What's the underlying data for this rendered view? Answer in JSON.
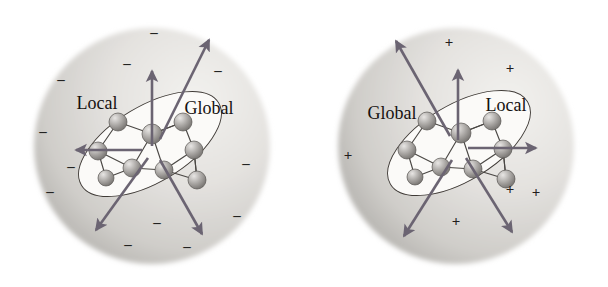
{
  "figure": {
    "background_color": "#ffffff",
    "width": 608,
    "height": 287
  },
  "colors": {
    "sphere_light": "#f2f1ee",
    "sphere_mid": "#cfcdc9",
    "sphere_dark": "#9d9b97",
    "cavity_fill": "#fbfaf8",
    "cavity_stroke": "#3f3a36",
    "arrow": "#6b6472",
    "atom_light": "#e8e6e4",
    "atom_mid": "#a9a6a3",
    "atom_dark": "#6a6764",
    "bond": "#4a4744",
    "sign_text": "#221d1c",
    "label_text": "#15110f"
  },
  "panels": [
    {
      "id": "panel-left",
      "name": "negative-solvent-panel",
      "sign_symbol": "–",
      "sign_kind": "minus",
      "sign_count": 12,
      "labels": [
        {
          "name": "local-label",
          "text": "Local",
          "x": 97,
          "y": 103
        },
        {
          "name": "global-label",
          "text": "Global",
          "x": 209,
          "y": 108
        }
      ],
      "signs": [
        {
          "x": 154,
          "y": 32
        },
        {
          "x": 127,
          "y": 63
        },
        {
          "x": 218,
          "y": 70
        },
        {
          "x": 61,
          "y": 79
        },
        {
          "x": 246,
          "y": 163
        },
        {
          "x": 71,
          "y": 166
        },
        {
          "x": 50,
          "y": 191
        },
        {
          "x": 237,
          "y": 215
        },
        {
          "x": 157,
          "y": 222
        },
        {
          "x": 128,
          "y": 244
        },
        {
          "x": 43,
          "y": 131
        },
        {
          "x": 187,
          "y": 246
        }
      ],
      "arrows": [
        {
          "name": "arrow-up",
          "x1": 152,
          "y1": 146,
          "x2": 152,
          "y2": 71
        },
        {
          "name": "arrow-up-right",
          "x1": 160,
          "y1": 139,
          "x2": 209,
          "y2": 40
        },
        {
          "name": "arrow-left",
          "x1": 142,
          "y1": 150,
          "x2": 76,
          "y2": 150
        },
        {
          "name": "arrow-down-left",
          "x1": 148,
          "y1": 158,
          "x2": 96,
          "y2": 230
        },
        {
          "name": "arrow-down-right",
          "x1": 160,
          "y1": 160,
          "x2": 202,
          "y2": 234
        }
      ],
      "cavity": {
        "cx": 150,
        "cy": 144,
        "rx": 80,
        "ry": 38,
        "rotation": -31
      },
      "sphere": {
        "cx": 152,
        "cy": 146,
        "r": 118
      },
      "gradient_highlight": {
        "cx": 0.68,
        "cy": 0.3
      }
    },
    {
      "id": "panel-right",
      "name": "positive-solvent-panel",
      "sign_symbol": "+",
      "sign_kind": "plus",
      "sign_count": 6,
      "labels": [
        {
          "name": "global-label",
          "text": "Global",
          "x": 88,
          "y": 113
        },
        {
          "name": "local-label",
          "text": "Local",
          "x": 202,
          "y": 105
        }
      ],
      "signs": [
        {
          "x": 145,
          "y": 42
        },
        {
          "x": 206,
          "y": 68
        },
        {
          "x": 44,
          "y": 155
        },
        {
          "x": 232,
          "y": 192
        },
        {
          "x": 152,
          "y": 221
        },
        {
          "x": 206,
          "y": 189
        }
      ],
      "arrows": [
        {
          "name": "arrow-up",
          "x1": 154,
          "y1": 140,
          "x2": 154,
          "y2": 70
        },
        {
          "name": "arrow-up-left",
          "x1": 146,
          "y1": 136,
          "x2": 92,
          "y2": 41
        },
        {
          "name": "arrow-right",
          "x1": 164,
          "y1": 148,
          "x2": 232,
          "y2": 148
        },
        {
          "name": "arrow-down-left",
          "x1": 148,
          "y1": 160,
          "x2": 100,
          "y2": 236
        },
        {
          "name": "arrow-down-right",
          "x1": 162,
          "y1": 158,
          "x2": 208,
          "y2": 232
        }
      ],
      "cavity": {
        "cx": 155,
        "cy": 143,
        "rx": 80,
        "ry": 38,
        "rotation": -31
      },
      "sphere": {
        "cx": 152,
        "cy": 146,
        "r": 118
      },
      "gradient_highlight": {
        "cx": 0.72,
        "cy": 0.32
      }
    }
  ],
  "cluster": {
    "name": "molecular-cluster",
    "atom_count": 9,
    "atoms": [
      {
        "id": "a1",
        "x": -32,
        "y": -26,
        "r": 9
      },
      {
        "id": "a2",
        "x": 2,
        "y": -14,
        "r": 10
      },
      {
        "id": "a3",
        "x": 33,
        "y": -26,
        "r": 9
      },
      {
        "id": "a4",
        "x": -52,
        "y": 3,
        "r": 9
      },
      {
        "id": "a5",
        "x": 44,
        "y": 2,
        "r": 9
      },
      {
        "id": "a6",
        "x": -18,
        "y": 20,
        "r": 9
      },
      {
        "id": "a7",
        "x": 14,
        "y": 22,
        "r": 9
      },
      {
        "id": "a8",
        "x": 47,
        "y": 32,
        "r": 9
      },
      {
        "id": "a9",
        "x": -44,
        "y": 30,
        "r": 8
      }
    ],
    "bonds": [
      [
        "a1",
        "a2"
      ],
      [
        "a2",
        "a3"
      ],
      [
        "a1",
        "a4"
      ],
      [
        "a3",
        "a5"
      ],
      [
        "a2",
        "a6"
      ],
      [
        "a2",
        "a7"
      ],
      [
        "a6",
        "a7"
      ],
      [
        "a4",
        "a6"
      ],
      [
        "a5",
        "a7"
      ],
      [
        "a5",
        "a8"
      ],
      [
        "a7",
        "a8"
      ],
      [
        "a4",
        "a9"
      ],
      [
        "a9",
        "a6"
      ],
      [
        "a3",
        "a2"
      ],
      [
        "a8",
        "a5"
      ]
    ]
  }
}
